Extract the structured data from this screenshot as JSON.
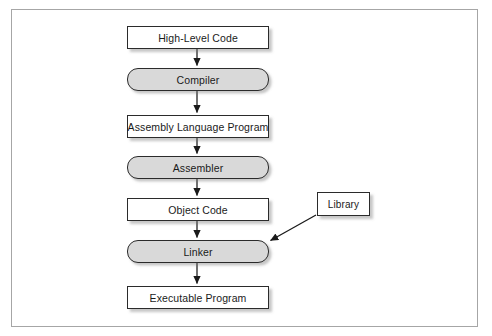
{
  "diagram": {
    "frame": {
      "border_color": "#a6a6a6"
    },
    "palette": {
      "artifact_fill": "#ffffff",
      "tool_fill": "#d9d9d9",
      "stroke": "#2b2b2b",
      "arrow": "#1a1a1a",
      "text": "#1a1a1a"
    },
    "nodes": [
      {
        "id": "high-level-code",
        "label": "High-Level Code",
        "shape": "rectangle",
        "kind": "artifact",
        "x": 126,
        "y": 25,
        "w": 142,
        "h": 23
      },
      {
        "id": "compiler",
        "label": "Compiler",
        "shape": "rounded",
        "kind": "tool",
        "x": 126,
        "y": 67,
        "h": 23,
        "w": 142
      },
      {
        "id": "assembly-language-program",
        "label": "Assembly Language Program",
        "shape": "rectangle",
        "kind": "artifact",
        "x": 126,
        "y": 114,
        "w": 142,
        "h": 23
      },
      {
        "id": "assembler",
        "label": "Assembler",
        "shape": "rounded",
        "kind": "tool",
        "x": 126,
        "y": 155,
        "w": 142,
        "h": 23
      },
      {
        "id": "object-code",
        "label": "Object Code",
        "shape": "rectangle",
        "kind": "artifact",
        "x": 126,
        "y": 197,
        "w": 142,
        "h": 23
      },
      {
        "id": "linker",
        "label": "Linker",
        "shape": "rounded",
        "kind": "tool",
        "x": 126,
        "y": 239,
        "w": 142,
        "h": 23
      },
      {
        "id": "executable-program",
        "label": "Executable Program",
        "shape": "rectangle",
        "kind": "artifact",
        "x": 126,
        "y": 285,
        "w": 142,
        "h": 23
      },
      {
        "id": "library",
        "label": "Library",
        "shape": "rectangle",
        "kind": "artifact",
        "x": 316,
        "y": 191,
        "w": 53,
        "h": 24
      }
    ],
    "edges": [
      {
        "from": "high-level-code",
        "to": "compiler",
        "style": "vertical-arrow"
      },
      {
        "from": "compiler",
        "to": "assembly-language-program",
        "style": "vertical-arrow"
      },
      {
        "from": "assembly-language-program",
        "to": "assembler",
        "style": "vertical-arrow"
      },
      {
        "from": "assembler",
        "to": "object-code",
        "style": "vertical-arrow"
      },
      {
        "from": "object-code",
        "to": "linker",
        "style": "vertical-arrow"
      },
      {
        "from": "linker",
        "to": "executable-program",
        "style": "vertical-arrow"
      },
      {
        "from": "library",
        "to": "linker",
        "style": "diagonal-arrow"
      }
    ]
  }
}
